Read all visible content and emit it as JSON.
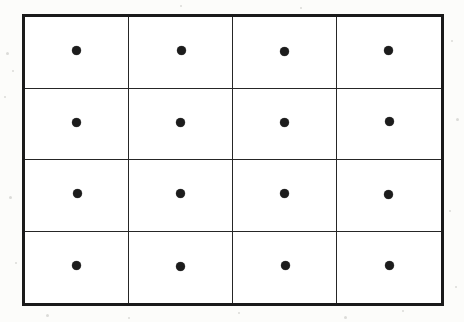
{
  "figure": {
    "colors": {
      "page_background": "#fcfcfa",
      "cell_background": "#ffffff",
      "outer_border": "#1a1a1a",
      "inner_line": "#262626",
      "dot": "#1c1c1c",
      "speck": "#c9c9c6"
    },
    "frame": {
      "outer_border_width_px": 3,
      "inner_line_width_px": 1.5,
      "left_px": 22,
      "top_px": 14,
      "width_px": 422,
      "height_px": 292
    },
    "grid": {
      "rows": 4,
      "columns": 4,
      "total_cells": 16,
      "dots_per_cell": 1,
      "total_dots": 16,
      "dot_diameter_px": 9
    },
    "cells": [
      {
        "row": 1,
        "column": 1,
        "dot": true,
        "jitter": "j0"
      },
      {
        "row": 1,
        "column": 2,
        "dot": true,
        "jitter": "j1"
      },
      {
        "row": 1,
        "column": 3,
        "dot": true,
        "jitter": "j2"
      },
      {
        "row": 1,
        "column": 4,
        "dot": true,
        "jitter": "j3"
      },
      {
        "row": 2,
        "column": 1,
        "dot": true,
        "jitter": "j2"
      },
      {
        "row": 2,
        "column": 2,
        "dot": true,
        "jitter": "j0"
      },
      {
        "row": 2,
        "column": 3,
        "dot": true,
        "jitter": "j3"
      },
      {
        "row": 2,
        "column": 4,
        "dot": true,
        "jitter": "j1"
      },
      {
        "row": 3,
        "column": 1,
        "dot": true,
        "jitter": "j1"
      },
      {
        "row": 3,
        "column": 2,
        "dot": true,
        "jitter": "j3"
      },
      {
        "row": 3,
        "column": 3,
        "dot": true,
        "jitter": "j0"
      },
      {
        "row": 3,
        "column": 4,
        "dot": true,
        "jitter": "j2"
      },
      {
        "row": 4,
        "column": 1,
        "dot": true,
        "jitter": "j3"
      },
      {
        "row": 4,
        "column": 2,
        "dot": true,
        "jitter": "j2"
      },
      {
        "row": 4,
        "column": 3,
        "dot": true,
        "jitter": "j1"
      },
      {
        "row": 4,
        "column": 4,
        "dot": true,
        "jitter": "j0"
      }
    ],
    "specks": [
      {
        "x": 6,
        "y": 52,
        "size": 3
      },
      {
        "x": 12,
        "y": 70,
        "size": 2
      },
      {
        "x": 4,
        "y": 96,
        "size": 2
      },
      {
        "x": 9,
        "y": 196,
        "size": 3
      },
      {
        "x": 15,
        "y": 262,
        "size": 2
      },
      {
        "x": 451,
        "y": 40,
        "size": 2
      },
      {
        "x": 456,
        "y": 118,
        "size": 3
      },
      {
        "x": 449,
        "y": 210,
        "size": 2
      },
      {
        "x": 455,
        "y": 286,
        "size": 2
      },
      {
        "x": 46,
        "y": 314,
        "size": 3
      },
      {
        "x": 128,
        "y": 317,
        "size": 2
      },
      {
        "x": 238,
        "y": 312,
        "size": 2
      },
      {
        "x": 344,
        "y": 316,
        "size": 3
      },
      {
        "x": 402,
        "y": 310,
        "size": 2
      },
      {
        "x": 180,
        "y": 5,
        "size": 2
      },
      {
        "x": 300,
        "y": 7,
        "size": 2
      },
      {
        "x": 392,
        "y": 26,
        "size": 2
      },
      {
        "x": 248,
        "y": 158,
        "size": 2
      }
    ]
  }
}
